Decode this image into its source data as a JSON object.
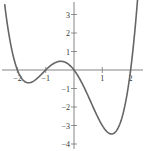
{
  "chart_data": {
    "type": "line",
    "title": "",
    "xlabel": "",
    "ylabel": "",
    "function": "y = 0.5·x(x+1)(x+2)(x-2)",
    "xlim": [
      -2.6,
      2.55
    ],
    "ylim": [
      -4.3,
      3.8
    ],
    "x_ticks": [
      -2,
      -1,
      1,
      2
    ],
    "x_tick_labels": [
      "-2",
      "-1",
      "1",
      "2"
    ],
    "y_ticks": [
      3,
      2,
      1,
      -1,
      -2,
      -3,
      -4
    ],
    "y_tick_labels": [
      "3",
      "2",
      "1",
      "-1",
      "-2",
      "-3",
      "-4"
    ],
    "grid": false,
    "legend": null,
    "series": [
      {
        "name": "f(x)",
        "color": "#666666",
        "x": [
          -2.45,
          -2.2,
          -2.0,
          -1.8,
          -1.6,
          -1.4,
          -1.2,
          -1.0,
          -0.8,
          -0.6,
          -0.4,
          -0.2,
          0.0,
          0.2,
          0.4,
          0.6,
          0.8,
          1.0,
          1.2,
          1.4,
          1.6,
          1.8,
          2.0,
          2.2,
          2.42
        ],
        "y": [
          3.4,
          1.39,
          0.0,
          -0.58,
          -0.69,
          -0.57,
          -0.31,
          0.0,
          0.27,
          0.42,
          0.45,
          0.35,
          0.0,
          -0.23,
          -0.59,
          -1.09,
          -1.62,
          -2.25,
          -2.71,
          -3.09,
          -3.12,
          -2.71,
          0.0,
          1.88,
          3.6
        ],
        "key_points": {
          "roots": [
            -2,
            -1,
            0,
            2
          ],
          "local_min_left": {
            "x": -1.6,
            "y": -0.69
          },
          "local_max": {
            "x": -0.45,
            "y": 0.46
          },
          "local_min_right": {
            "x": 1.45,
            "y": -3.4
          }
        }
      }
    ]
  }
}
